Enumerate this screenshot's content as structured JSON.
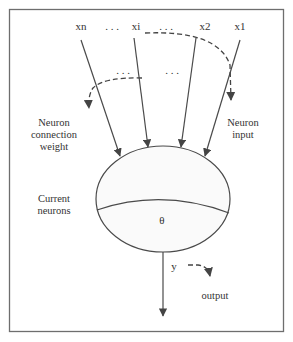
{
  "diagram": {
    "type": "neuron-model",
    "inputs": [
      {
        "label": "xn"
      },
      {
        "label": "xi"
      },
      {
        "label": "x2"
      },
      {
        "label": "x1"
      }
    ],
    "ellipsis": ". . .",
    "labels": {
      "connection_weight_line1": "Neuron",
      "connection_weight_line2": "connection",
      "connection_weight_line3": "weight",
      "neuron_input_line1": "Neuron",
      "neuron_input_line2": "input",
      "current_neurons_line1": "Current",
      "current_neurons_line2": "neurons",
      "threshold": "θ",
      "output_var": "y",
      "output_label": "output"
    },
    "colors": {
      "frame": "#6e6e6e",
      "line": "#4a4a4a",
      "text": "#333333",
      "ellipse_fill": "#fafafa"
    }
  }
}
